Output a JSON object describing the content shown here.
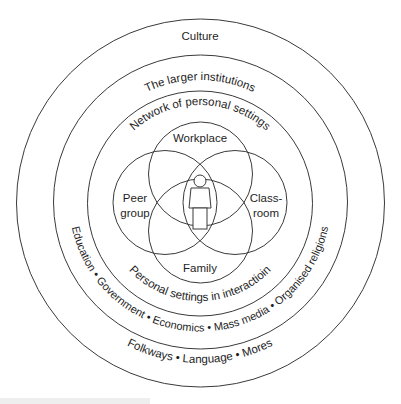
{
  "diagram": {
    "rings": {
      "outer": {
        "label": "Culture",
        "sublabel": "Folkways • Language • Mores"
      },
      "institutions": {
        "label": "The larger institutions",
        "sublabel": "Education • Government • Economics • Mass media • Organised religions"
      },
      "network": {
        "label": "Network of personal settings",
        "sublabel": "Personal settings in interactioin"
      }
    },
    "venn": {
      "top": {
        "label": "Workplace"
      },
      "left": {
        "line1": "Peer",
        "line2": "group"
      },
      "right": {
        "line1": "Class-",
        "line2": "room"
      },
      "bottom": {
        "label": "Family"
      }
    },
    "center_icon": "person-icon"
  },
  "colors": {
    "stroke": "#3a3a3a",
    "text": "#1e1e1e",
    "background": "#ffffff"
  }
}
